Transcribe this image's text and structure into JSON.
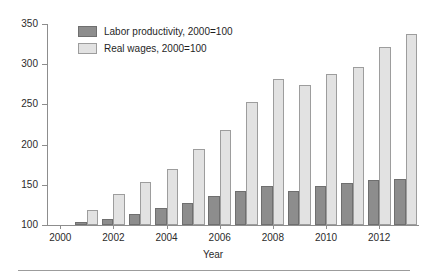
{
  "chart_data": {
    "type": "bar",
    "title": "",
    "subtitle": "",
    "xlabel": "Year",
    "ylabel": "",
    "ylim": [
      100,
      350
    ],
    "ytick_values": [
      100,
      150,
      200,
      250,
      300,
      350
    ],
    "ytick_labels": [
      "100",
      "150",
      "200",
      "250",
      "300",
      "350"
    ],
    "grid": false,
    "legend_position": "top-left-inside",
    "categories": [
      2001,
      2002,
      2003,
      2004,
      2005,
      2006,
      2007,
      2008,
      2009,
      2010,
      2011,
      2012,
      2013
    ],
    "xtick_values": [
      2000,
      2002,
      2004,
      2006,
      2008,
      2010,
      2012
    ],
    "xtick_labels": [
      "2000",
      "2002",
      "2004",
      "2006",
      "2008",
      "2010",
      "2012"
    ],
    "series": [
      {
        "name": "Labor productivity, 2000=100",
        "color": "#8d8d8d",
        "values": [
          104,
          107,
          114,
          121,
          127,
          136,
          142,
          149,
          142,
          148,
          152,
          156,
          157
        ]
      },
      {
        "name": "Real wages, 2000=100",
        "color": "#e2e2e2",
        "values": [
          119,
          138,
          153,
          170,
          194,
          218,
          253,
          282,
          274,
          288,
          296,
          321,
          337
        ]
      }
    ]
  },
  "legend": {
    "items": [
      {
        "label": "Labor productivity, 2000=100"
      },
      {
        "label": "Real wages, 2000=100"
      }
    ]
  },
  "axes": {
    "x_title": "Year"
  }
}
